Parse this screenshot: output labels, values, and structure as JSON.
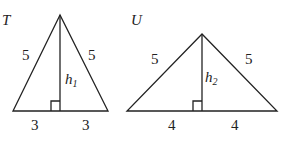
{
  "diagram": {
    "triangles": [
      {
        "name": "T",
        "sides": {
          "left": "5",
          "right": "5"
        },
        "base_halves": [
          "3",
          "3"
        ],
        "height_label": "h",
        "height_subscript": "1"
      },
      {
        "name": "U",
        "sides": {
          "left": "5",
          "right": "5"
        },
        "base_halves": [
          "4",
          "4"
        ],
        "height_label": "h",
        "height_subscript": "2"
      }
    ]
  }
}
